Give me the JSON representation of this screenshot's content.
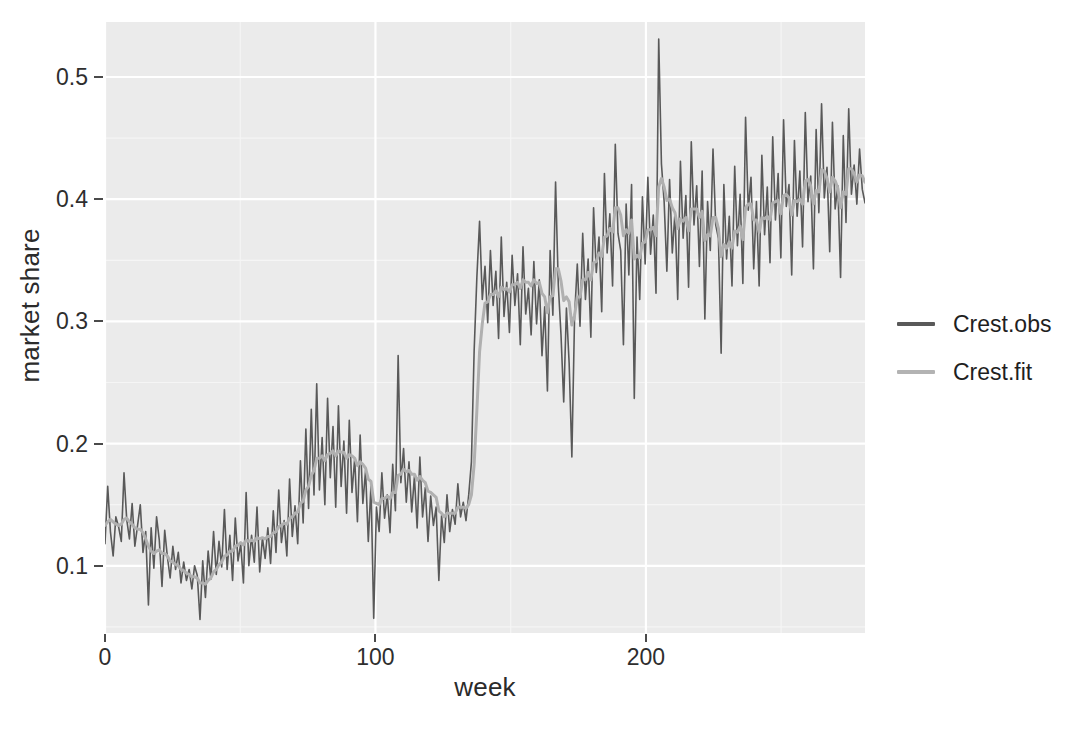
{
  "chart_data": {
    "type": "line",
    "title": "",
    "xlabel": "week",
    "ylabel": "market share",
    "xlim": [
      0,
      281
    ],
    "ylim": [
      0.045,
      0.545
    ],
    "x_ticks": [
      0,
      100,
      200
    ],
    "x_tick_labels": [
      "0",
      "100",
      "200"
    ],
    "y_ticks": [
      0.1,
      0.2,
      0.3,
      0.4,
      0.5
    ],
    "y_tick_labels": [
      "0.1",
      "0.2",
      "0.3",
      "0.4",
      "0.5"
    ],
    "grid": true,
    "grid_major_color": "#ffffff",
    "grid_minor_color": "#f5f5f5",
    "panel_background": "#ebebeb",
    "legend_position": "right",
    "series": [
      {
        "name": "Crest.obs",
        "color": "#595959",
        "width": 1.6,
        "values": [
          0.118,
          0.165,
          0.128,
          0.108,
          0.14,
          0.132,
          0.12,
          0.176,
          0.138,
          0.122,
          0.151,
          0.116,
          0.133,
          0.15,
          0.111,
          0.128,
          0.068,
          0.131,
          0.098,
          0.14,
          0.121,
          0.083,
          0.129,
          0.107,
          0.09,
          0.116,
          0.097,
          0.111,
          0.086,
          0.103,
          0.088,
          0.097,
          0.081,
          0.1,
          0.092,
          0.056,
          0.104,
          0.074,
          0.112,
          0.089,
          0.128,
          0.093,
          0.12,
          0.099,
          0.146,
          0.097,
          0.125,
          0.088,
          0.139,
          0.104,
          0.118,
          0.086,
          0.16,
          0.1,
          0.125,
          0.103,
          0.148,
          0.095,
          0.123,
          0.106,
          0.131,
          0.102,
          0.145,
          0.111,
          0.162,
          0.119,
          0.137,
          0.108,
          0.171,
          0.124,
          0.149,
          0.118,
          0.186,
          0.135,
          0.212,
          0.147,
          0.228,
          0.158,
          0.249,
          0.162,
          0.205,
          0.15,
          0.237,
          0.172,
          0.214,
          0.148,
          0.231,
          0.165,
          0.202,
          0.143,
          0.219,
          0.16,
          0.188,
          0.136,
          0.207,
          0.151,
          0.178,
          0.12,
          0.166,
          0.057,
          0.148,
          0.128,
          0.176,
          0.139,
          0.158,
          0.127,
          0.183,
          0.145,
          0.272,
          0.168,
          0.196,
          0.152,
          0.185,
          0.144,
          0.173,
          0.131,
          0.189,
          0.14,
          0.164,
          0.12,
          0.157,
          0.133,
          0.148,
          0.088,
          0.141,
          0.119,
          0.158,
          0.128,
          0.146,
          0.134,
          0.167,
          0.14,
          0.152,
          0.137,
          0.158,
          0.185,
          0.276,
          0.336,
          0.382,
          0.318,
          0.345,
          0.299,
          0.358,
          0.313,
          0.341,
          0.286,
          0.369,
          0.304,
          0.332,
          0.291,
          0.354,
          0.313,
          0.339,
          0.281,
          0.361,
          0.306,
          0.327,
          0.289,
          0.349,
          0.298,
          0.334,
          0.272,
          0.312,
          0.243,
          0.358,
          0.305,
          0.414,
          0.33,
          0.289,
          0.234,
          0.311,
          0.266,
          0.189,
          0.304,
          0.347,
          0.296,
          0.372,
          0.318,
          0.351,
          0.287,
          0.393,
          0.34,
          0.369,
          0.308,
          0.421,
          0.356,
          0.388,
          0.329,
          0.445,
          0.372,
          0.358,
          0.281,
          0.396,
          0.338,
          0.412,
          0.237,
          0.369,
          0.318,
          0.402,
          0.347,
          0.418,
          0.355,
          0.387,
          0.323,
          0.531,
          0.429,
          0.398,
          0.341,
          0.416,
          0.356,
          0.389,
          0.318,
          0.431,
          0.368,
          0.403,
          0.328,
          0.447,
          0.379,
          0.411,
          0.345,
          0.423,
          0.302,
          0.398,
          0.358,
          0.441,
          0.379,
          0.368,
          0.274,
          0.412,
          0.351,
          0.386,
          0.329,
          0.427,
          0.362,
          0.404,
          0.331,
          0.467,
          0.391,
          0.418,
          0.343,
          0.398,
          0.329,
          0.436,
          0.371,
          0.41,
          0.348,
          0.451,
          0.383,
          0.421,
          0.352,
          0.465,
          0.394,
          0.412,
          0.338,
          0.448,
          0.386,
          0.423,
          0.361,
          0.471,
          0.398,
          0.419,
          0.343,
          0.457,
          0.389,
          0.478,
          0.401,
          0.426,
          0.357,
          0.463,
          0.392,
          0.411,
          0.336,
          0.452,
          0.381,
          0.474,
          0.404,
          0.428,
          0.396,
          0.441,
          0.408,
          0.397
        ]
      },
      {
        "name": "Crest.fit",
        "color": "#b0b0b0",
        "width": 3.0,
        "values": [
          0.133,
          0.136,
          0.138,
          0.136,
          0.134,
          0.133,
          0.134,
          0.138,
          0.139,
          0.136,
          0.134,
          0.131,
          0.13,
          0.13,
          0.127,
          0.122,
          0.116,
          0.112,
          0.11,
          0.112,
          0.113,
          0.11,
          0.11,
          0.108,
          0.104,
          0.103,
          0.101,
          0.1,
          0.097,
          0.096,
          0.094,
          0.093,
          0.091,
          0.091,
          0.09,
          0.086,
          0.086,
          0.085,
          0.088,
          0.09,
          0.095,
          0.097,
          0.101,
          0.103,
          0.108,
          0.109,
          0.112,
          0.112,
          0.116,
          0.117,
          0.119,
          0.117,
          0.121,
          0.12,
          0.121,
          0.12,
          0.123,
          0.122,
          0.123,
          0.122,
          0.124,
          0.124,
          0.127,
          0.128,
          0.132,
          0.133,
          0.135,
          0.134,
          0.139,
          0.14,
          0.143,
          0.144,
          0.151,
          0.153,
          0.162,
          0.165,
          0.174,
          0.178,
          0.188,
          0.188,
          0.19,
          0.186,
          0.191,
          0.192,
          0.194,
          0.19,
          0.194,
          0.193,
          0.193,
          0.188,
          0.191,
          0.19,
          0.188,
          0.182,
          0.185,
          0.183,
          0.18,
          0.171,
          0.169,
          0.152,
          0.151,
          0.15,
          0.155,
          0.155,
          0.157,
          0.155,
          0.16,
          0.16,
          0.174,
          0.175,
          0.179,
          0.177,
          0.178,
          0.175,
          0.175,
          0.17,
          0.173,
          0.17,
          0.168,
          0.161,
          0.16,
          0.158,
          0.156,
          0.145,
          0.143,
          0.14,
          0.143,
          0.143,
          0.143,
          0.143,
          0.148,
          0.148,
          0.148,
          0.147,
          0.15,
          0.158,
          0.183,
          0.227,
          0.275,
          0.298,
          0.315,
          0.316,
          0.322,
          0.322,
          0.325,
          0.32,
          0.328,
          0.326,
          0.327,
          0.324,
          0.33,
          0.33,
          0.332,
          0.327,
          0.334,
          0.332,
          0.332,
          0.329,
          0.334,
          0.331,
          0.332,
          0.323,
          0.32,
          0.307,
          0.32,
          0.321,
          0.343,
          0.343,
          0.333,
          0.317,
          0.32,
          0.316,
          0.297,
          0.305,
          0.32,
          0.32,
          0.334,
          0.334,
          0.34,
          0.334,
          0.348,
          0.349,
          0.356,
          0.353,
          0.369,
          0.37,
          0.376,
          0.373,
          0.393,
          0.393,
          0.387,
          0.37,
          0.375,
          0.372,
          0.383,
          0.351,
          0.354,
          0.352,
          0.364,
          0.365,
          0.375,
          0.375,
          0.377,
          0.37,
          0.41,
          0.417,
          0.41,
          0.399,
          0.4,
          0.393,
          0.389,
          0.376,
          0.384,
          0.382,
          0.385,
          0.374,
          0.392,
          0.392,
          0.392,
          0.385,
          0.39,
          0.366,
          0.371,
          0.37,
          0.385,
          0.385,
          0.376,
          0.353,
          0.363,
          0.36,
          0.365,
          0.36,
          0.374,
          0.373,
          0.378,
          0.367,
          0.393,
          0.396,
          0.396,
          0.383,
          0.383,
          0.373,
          0.385,
          0.384,
          0.386,
          0.383,
          0.397,
          0.398,
          0.399,
          0.388,
          0.403,
          0.404,
          0.401,
          0.387,
          0.399,
          0.398,
          0.4,
          0.396,
          0.415,
          0.416,
          0.411,
          0.396,
          0.407,
          0.406,
          0.424,
          0.423,
          0.417,
          0.406,
          0.418,
          0.415,
          0.409,
          0.393,
          0.406,
          0.404,
          0.425,
          0.425,
          0.421,
          0.414,
          0.42,
          0.419,
          0.414
        ]
      }
    ]
  },
  "legend": {
    "items": [
      {
        "label": "Crest.obs",
        "color": "#595959",
        "width": 4
      },
      {
        "label": "Crest.fit",
        "color": "#b3b3b3",
        "width": 4
      }
    ]
  },
  "axes": {
    "x_title": "week",
    "y_title": "market share"
  }
}
